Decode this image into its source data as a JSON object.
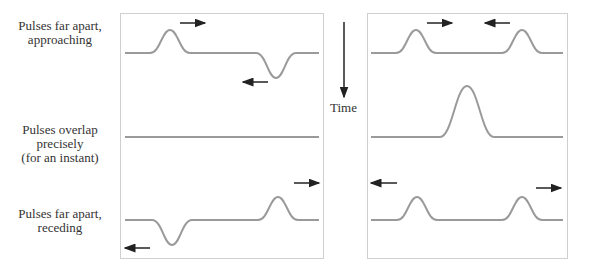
{
  "rows": [
    {
      "label_line1": "Pulses far apart,",
      "label_line2": "approaching",
      "label_line3": ""
    },
    {
      "label_line1": "Pulses overlap",
      "label_line2": "precisely",
      "label_line3": "(for an instant)"
    },
    {
      "label_line1": "Pulses far apart,",
      "label_line2": "receding",
      "label_line3": ""
    }
  ],
  "time_axis": {
    "label": "Time",
    "direction": "down"
  },
  "panels": [
    {
      "name": "left",
      "description": "Positive and inverted pulses — destructive interference",
      "rows": [
        {
          "pulses": [
            {
              "x": 170,
              "amp": 23,
              "dir": "right"
            },
            {
              "x": 276,
              "amp": -25,
              "dir": "left"
            }
          ]
        },
        {
          "pulses": []
        },
        {
          "pulses": [
            {
              "x": 172,
              "amp": -25,
              "dir": "left"
            },
            {
              "x": 278,
              "amp": 23,
              "dir": "right"
            }
          ]
        }
      ]
    },
    {
      "name": "right",
      "description": "Two positive pulses — constructive interference",
      "rows": [
        {
          "pulses": [
            {
              "x": 416,
              "amp": 23,
              "dir": "right"
            },
            {
              "x": 522,
              "amp": 23,
              "dir": "left"
            }
          ]
        },
        {
          "pulses": [
            {
              "x": 467,
              "amp": 51
            }
          ]
        },
        {
          "pulses": [
            {
              "x": 417,
              "amp": 23,
              "dir": "left"
            },
            {
              "x": 522,
              "amp": 23,
              "dir": "right"
            }
          ]
        }
      ]
    }
  ],
  "colors": {
    "wave": "#9a9a9a",
    "arrow": "#222222",
    "border": "#cfcfcf"
  }
}
